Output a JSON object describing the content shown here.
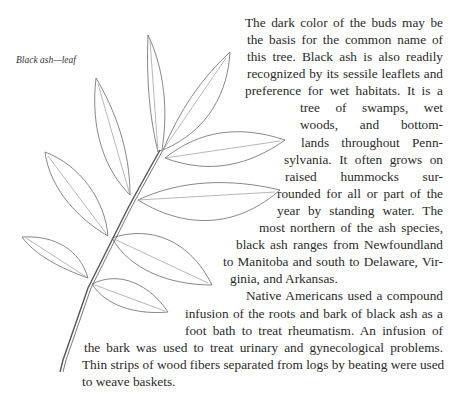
{
  "figure": {
    "caption": "Black ash—leaf",
    "illustration": "black-ash-compound-leaf-drawing"
  },
  "text": {
    "lines": [
      {
        "t": "The dark color of the buds may be",
        "x": 245,
        "y": 14,
        "w": 198
      },
      {
        "t": "the basis for the common name of",
        "x": 247,
        "y": 31,
        "w": 196
      },
      {
        "t": "this tree. Black ash is also readily",
        "x": 247,
        "y": 48,
        "w": 196
      },
      {
        "t": "recognized by its sessile leaflets and",
        "x": 247,
        "y": 65,
        "w": 196
      },
      {
        "t": "preference for wet habitats. It is a",
        "x": 245,
        "y": 82,
        "w": 198
      },
      {
        "t": "tree of swamps, wet",
        "x": 300,
        "y": 99,
        "w": 143
      },
      {
        "t": "woods, and bottom-",
        "x": 300,
        "y": 116,
        "w": 143
      },
      {
        "t": "lands throughout Penn-",
        "x": 301,
        "y": 134,
        "w": 142
      },
      {
        "t": "sylvania. It often grows on",
        "x": 284,
        "y": 151,
        "w": 159
      },
      {
        "t": "raised hummocks sur-",
        "x": 285,
        "y": 168,
        "w": 158
      },
      {
        "t": "rounded for all or part of the",
        "x": 277,
        "y": 185,
        "w": 166
      },
      {
        "t": "year by standing water. The",
        "x": 277,
        "y": 202,
        "w": 166
      },
      {
        "t": "most northern of the ash species,",
        "x": 259,
        "y": 219,
        "w": 184
      },
      {
        "t": "black ash ranges from Newfoundland",
        "x": 236,
        "y": 236,
        "w": 207
      },
      {
        "t": "to Manitoba and south to Delaware, Vir-",
        "x": 223,
        "y": 253,
        "w": 220
      },
      {
        "t": "ginia, and Arkansas.",
        "x": 230,
        "y": 270,
        "w": 0
      },
      {
        "t": "Native Americans used a compound",
        "x": 246,
        "y": 287,
        "w": 197
      },
      {
        "t": "infusion of the roots and bark of black ash as a",
        "x": 185,
        "y": 305,
        "w": 258
      },
      {
        "t": "foot bath to treat rheumatism. An infusion of",
        "x": 185,
        "y": 322,
        "w": 258
      },
      {
        "t": "the bark was used to treat urinary and gynecological problems.",
        "x": 84,
        "y": 339,
        "w": 359
      },
      {
        "t": "Thin strips of wood fibers separated from logs by beating were used",
        "x": 82,
        "y": 356,
        "w": 361
      },
      {
        "t": "to weave baskets.",
        "x": 82,
        "y": 373,
        "w": 0
      }
    ]
  }
}
